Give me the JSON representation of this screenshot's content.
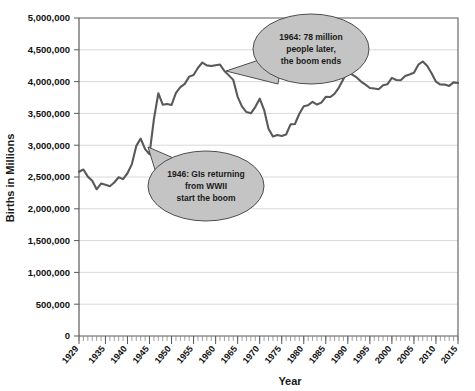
{
  "chart_data": {
    "type": "line",
    "title": "",
    "xlabel": "Year",
    "ylabel": "Births in Millions",
    "xlim": [
      1929,
      2015
    ],
    "ylim": [
      0,
      5000000
    ],
    "grid": true,
    "legend": null,
    "y_ticks": [
      0,
      500000,
      1000000,
      1500000,
      2000000,
      2500000,
      3000000,
      3500000,
      4000000,
      4500000,
      5000000
    ],
    "y_tick_labels": [
      "0",
      "500,000",
      "1,000,000",
      "1,500,000",
      "2,000,000",
      "2,500,000",
      "3,000,000",
      "3,500,000",
      "4,000,000",
      "4,500,000",
      "5,000,000"
    ],
    "x_ticks": [
      1929,
      1935,
      1940,
      1945,
      1950,
      1955,
      1960,
      1965,
      1970,
      1975,
      1980,
      1985,
      1990,
      1995,
      2000,
      2005,
      2010,
      2015
    ],
    "x_tick_labels": [
      "1929",
      "1935",
      "1940",
      "1945",
      "1950",
      "1955",
      "1960",
      "1965",
      "1970",
      "1975",
      "1980",
      "1985",
      "1990",
      "1995",
      "2000",
      "2005",
      "2010",
      "2015"
    ],
    "series_name": "US Births",
    "line_color": "#595959",
    "x": [
      1929,
      1930,
      1931,
      1932,
      1933,
      1934,
      1935,
      1936,
      1937,
      1938,
      1939,
      1940,
      1941,
      1942,
      1943,
      1944,
      1945,
      1946,
      1947,
      1948,
      1949,
      1950,
      1951,
      1952,
      1953,
      1954,
      1955,
      1956,
      1957,
      1958,
      1959,
      1960,
      1961,
      1962,
      1963,
      1964,
      1965,
      1966,
      1967,
      1968,
      1969,
      1970,
      1971,
      1972,
      1973,
      1974,
      1975,
      1976,
      1977,
      1978,
      1979,
      1980,
      1981,
      1982,
      1983,
      1984,
      1985,
      1986,
      1987,
      1988,
      1989,
      1990,
      1991,
      1992,
      1993,
      1994,
      1995,
      1996,
      1997,
      1998,
      1999,
      2000,
      2001,
      2002,
      2003,
      2004,
      2005,
      2006,
      2007,
      2008,
      2009,
      2010,
      2011,
      2012,
      2013,
      2014,
      2015
    ],
    "y": [
      2582000,
      2618000,
      2506000,
      2440000,
      2307000,
      2396000,
      2377000,
      2355000,
      2413000,
      2496000,
      2466000,
      2559000,
      2703000,
      2989000,
      3104000,
      2939000,
      2858000,
      3411000,
      3817000,
      3637000,
      3649000,
      3632000,
      3823000,
      3913000,
      3965000,
      4078000,
      4104000,
      4218000,
      4300000,
      4255000,
      4245000,
      4258000,
      4268000,
      4167000,
      4098000,
      4027000,
      3760000,
      3606000,
      3521000,
      3502000,
      3600000,
      3731000,
      3556000,
      3258000,
      3137000,
      3160000,
      3144000,
      3168000,
      3327000,
      3333000,
      3494000,
      3612000,
      3629000,
      3681000,
      3639000,
      3669000,
      3761000,
      3757000,
      3809000,
      3910000,
      4041000,
      4158000,
      4111000,
      4065000,
      4000000,
      3953000,
      3900000,
      3891000,
      3881000,
      3942000,
      3959000,
      4059000,
      4026000,
      4022000,
      4090000,
      4112000,
      4138000,
      4266000,
      4316000,
      4248000,
      4131000,
      3999000,
      3954000,
      3953000,
      3932000,
      3988000,
      3978000
    ],
    "annotations": [
      {
        "id": "boom-end-callout",
        "text_lines": [
          "1964: 78 million",
          "people later,",
          "the boom ends"
        ],
        "points_to_year": 1957,
        "points_to_value": 4300000
      },
      {
        "id": "boom-start-callout",
        "text_lines": [
          "1946: GIs returning",
          "from WWII",
          "start the boom"
        ],
        "points_to_year": 1943,
        "points_to_value": 3104000
      }
    ]
  }
}
